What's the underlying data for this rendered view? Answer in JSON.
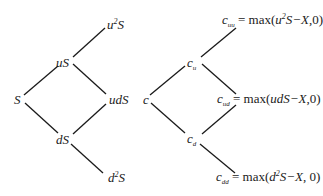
{
  "stock_tree": {
    "nodes": {
      "root": {
        "base": "S"
      },
      "up": {
        "base": "uS"
      },
      "down": {
        "base": "dS"
      },
      "upup": {
        "prefix": "u",
        "sup": "2",
        "suffix": "S"
      },
      "updown": {
        "base": "udS"
      },
      "downdown": {
        "prefix": "d",
        "sup": "2",
        "suffix": "S"
      }
    }
  },
  "option_tree": {
    "nodes": {
      "root": {
        "base": "c"
      },
      "up": {
        "base": "c",
        "sub": "u"
      },
      "down": {
        "base": "c",
        "sub": "d"
      },
      "upup": {
        "base": "c",
        "sub": "uu",
        "eq": " = max(",
        "arg_prefix": "u",
        "arg_sup": "2",
        "arg_suffix": "S−X",
        "tail": ",0)"
      },
      "updown": {
        "base": "c",
        "sub": "ud",
        "eq": " = max(",
        "arg": "udS−X",
        "tail": ",0)"
      },
      "downdown": {
        "base": "c",
        "sub": "dd",
        "eq": " = max(",
        "arg_prefix": "d",
        "arg_sup": "2",
        "arg_suffix": "S−X",
        "tail": ", 0)"
      }
    }
  },
  "colors": {
    "line": "#1a1a1a",
    "text": "#1a1a1a",
    "background": "#ffffff"
  }
}
